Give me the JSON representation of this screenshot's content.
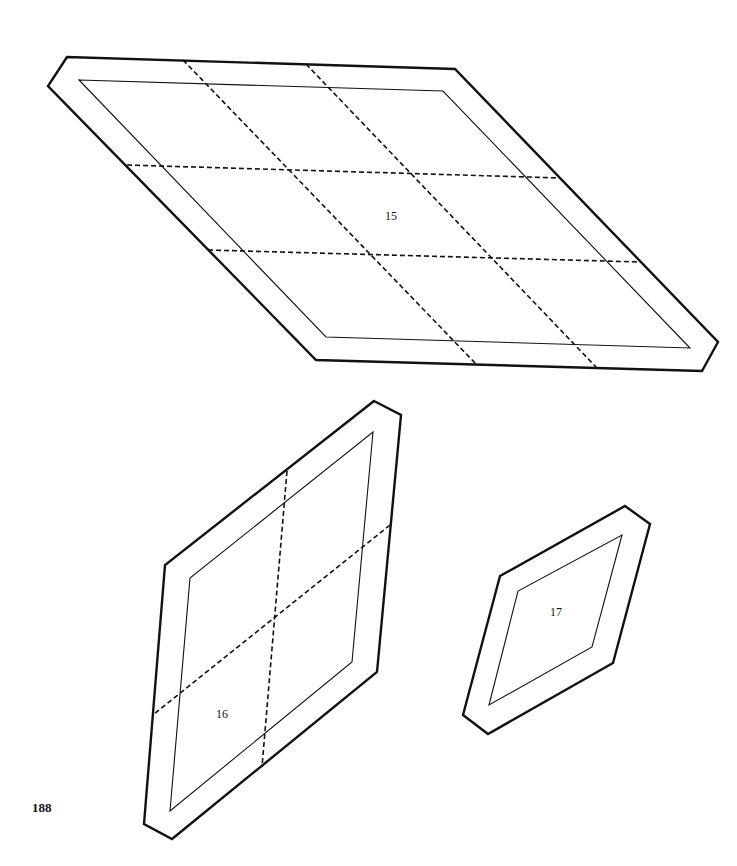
{
  "page": {
    "number": "188",
    "background": "#ffffff",
    "ink": "#111111"
  },
  "templates": [
    {
      "id": "15",
      "label": "15",
      "description": "Large parallelogram template with seam allowance, divided into a 3x3 grid by dashed cut lines"
    },
    {
      "id": "16",
      "label": "16",
      "description": "Medium parallelogram template with seam allowance, divided into a 2x2 grid by dashed cut lines"
    },
    {
      "id": "17",
      "label": "17",
      "description": "Small rhombus template with seam allowance, no internal cut lines"
    }
  ]
}
